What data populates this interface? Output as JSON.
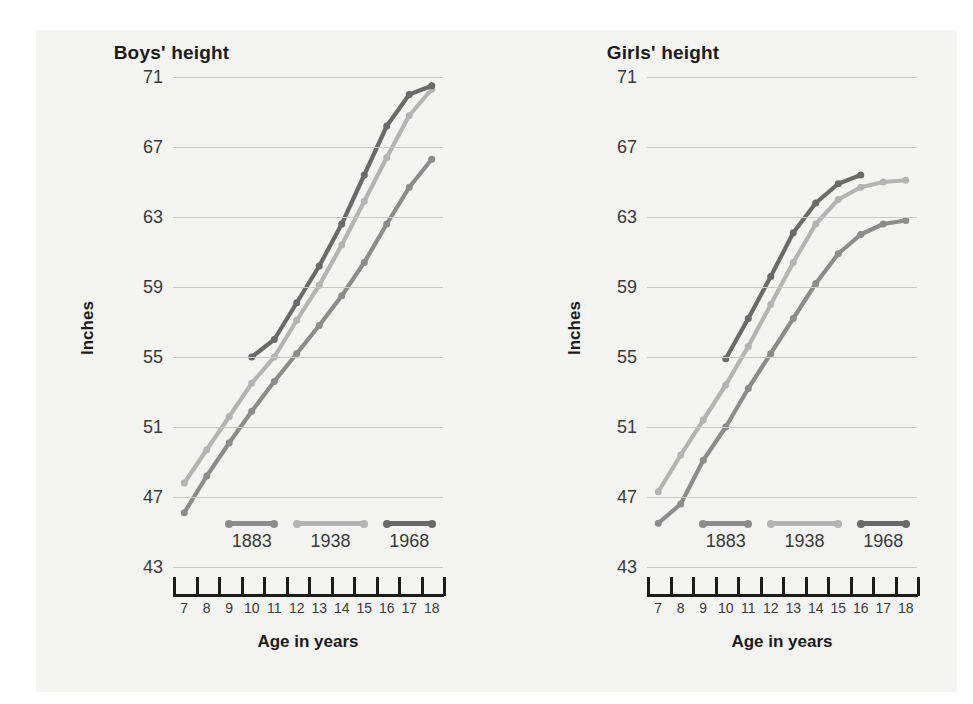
{
  "figure": {
    "background_color": "#f4f4f2",
    "axis_color": "#1b1b1b",
    "grid_color": "#c9c9c7"
  },
  "series_colors": {
    "1883": "#8c8c8c",
    "1938": "#b4b4b4",
    "1968": "#6a6a6a"
  },
  "legend": {
    "items": [
      {
        "label": "1883",
        "color": "#8c8c8c"
      },
      {
        "label": "1938",
        "color": "#b4b4b4"
      },
      {
        "label": "1968",
        "color": "#6a6a6a"
      }
    ]
  },
  "axis": {
    "ylabel": "Inches",
    "xlabel": "Age in years",
    "yticks": [
      71,
      67,
      63,
      59,
      55,
      51,
      47,
      43
    ],
    "xticks": [
      7,
      8,
      9,
      10,
      11,
      12,
      13,
      14,
      15,
      16,
      17,
      18
    ]
  },
  "chart_data": [
    {
      "type": "line",
      "title": "Boys' height",
      "xlabel": "Age in years",
      "ylabel": "Inches",
      "ylim": [
        43,
        71
      ],
      "xlim": [
        6.5,
        18.5
      ],
      "grid": true,
      "legend_position": "inside-bottom",
      "x": [
        7,
        8,
        9,
        10,
        11,
        12,
        13,
        14,
        15,
        16,
        17,
        18
      ],
      "series": [
        {
          "name": "1883",
          "color": "#8c8c8c",
          "values": [
            46.1,
            48.2,
            50.1,
            51.9,
            53.6,
            55.2,
            56.8,
            58.5,
            60.4,
            62.6,
            64.7,
            66.3
          ]
        },
        {
          "name": "1938",
          "color": "#b4b4b4",
          "values": [
            47.8,
            49.7,
            51.6,
            53.5,
            55.0,
            57.1,
            59.1,
            61.4,
            63.9,
            66.4,
            68.8,
            70.3
          ]
        },
        {
          "name": "1968",
          "color": "#6a6a6a",
          "values": [
            null,
            null,
            null,
            55.0,
            56.0,
            58.1,
            60.2,
            62.6,
            65.4,
            68.2,
            70.0,
            70.5
          ]
        }
      ]
    },
    {
      "type": "line",
      "title": "Girls' height",
      "xlabel": "Age in years",
      "ylabel": "Inches",
      "ylim": [
        43,
        71
      ],
      "xlim": [
        6.5,
        18.5
      ],
      "grid": true,
      "legend_position": "inside-bottom",
      "x": [
        7,
        8,
        9,
        10,
        11,
        12,
        13,
        14,
        15,
        16,
        17,
        18
      ],
      "series": [
        {
          "name": "1883",
          "color": "#8c8c8c",
          "values": [
            45.5,
            46.6,
            49.1,
            51.0,
            53.2,
            55.2,
            57.2,
            59.2,
            60.9,
            62.0,
            62.6,
            62.8
          ]
        },
        {
          "name": "1938",
          "color": "#b4b4b4",
          "values": [
            47.3,
            49.4,
            51.4,
            53.4,
            55.6,
            58.0,
            60.4,
            62.6,
            64.0,
            64.7,
            65.0,
            65.1
          ]
        },
        {
          "name": "1968",
          "color": "#6a6a6a",
          "values": [
            null,
            null,
            null,
            54.9,
            57.2,
            59.6,
            62.1,
            63.8,
            64.9,
            65.4,
            null,
            null
          ]
        }
      ]
    }
  ]
}
